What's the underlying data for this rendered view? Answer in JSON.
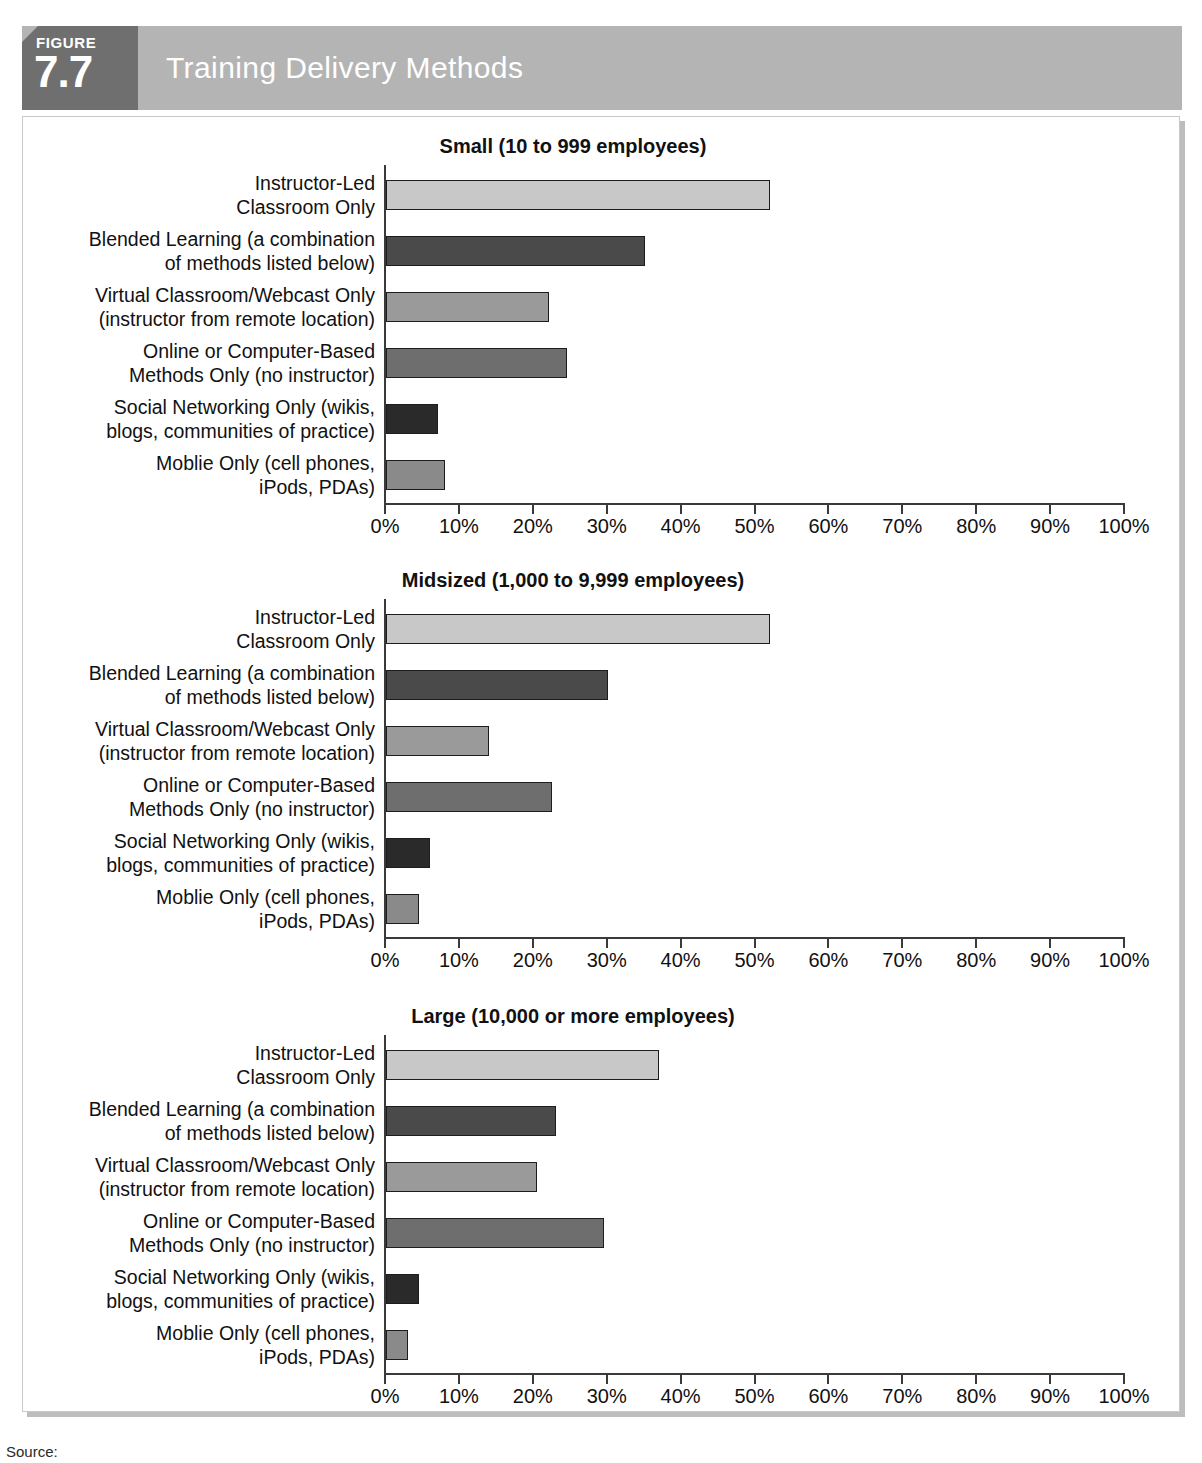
{
  "figure": {
    "tab_word": "FIGURE",
    "tab_number": "7.7",
    "title": "Training Delivery Methods"
  },
  "footer": {
    "source": "Source:"
  },
  "palette": {
    "banner_bg": "#b4b4b4",
    "tab_bg": "#6f6f6f",
    "frame_border": "#c9c9c9",
    "axis": "#3a3a3a",
    "bar_colors": [
      "#c8c8c8",
      "#4a4a4a",
      "#9a9a9a",
      "#6e6e6e",
      "#2a2a2a",
      "#8a8a8a"
    ]
  },
  "chart_data": {
    "type": "bar",
    "orientation": "horizontal",
    "title": "Training Delivery Methods",
    "xlabel": "",
    "ylabel": "",
    "xlim": [
      0,
      100
    ],
    "grid": false,
    "legend": "none",
    "tick_labels": [
      "0%",
      "10%",
      "20%",
      "30%",
      "40%",
      "50%",
      "60%",
      "70%",
      "80%",
      "90%",
      "100%"
    ],
    "tick_values": [
      0,
      10,
      20,
      30,
      40,
      50,
      60,
      70,
      80,
      90,
      100
    ],
    "categories": [
      "Instructor-Led Classroom Only",
      "Blended Learning (a combination of methods listed below)",
      "Virtual Classroom/Webcast Only (instructor from remote location)",
      "Online or Computer-Based Methods Only (no instructor)",
      "Social Networking Only (wikis, blogs, communities of practice)",
      "Moblie Only (cell phones, iPods, PDAs)"
    ],
    "category_lines": [
      [
        "Instructor-Led",
        "Classroom Only"
      ],
      [
        "Blended Learning (a combination",
        "of methods listed below)"
      ],
      [
        "Virtual Classroom/Webcast Only",
        "(instructor from remote location)"
      ],
      [
        "Online or Computer-Based",
        "Methods Only (no instructor)"
      ],
      [
        "Social Networking Only (wikis,",
        "blogs, communities of practice)"
      ],
      [
        "Moblie Only (cell phones,",
        "iPods, PDAs)"
      ]
    ],
    "panels": [
      {
        "title": "Small (10 to 999 employees)",
        "values": [
          52,
          35,
          22,
          24.5,
          7,
          8
        ]
      },
      {
        "title": "Midsized (1,000 to 9,999 employees)",
        "values": [
          52,
          30,
          14,
          22.5,
          6,
          4.5
        ]
      },
      {
        "title": "Large (10,000 or more employees)",
        "values": [
          37,
          23,
          20.5,
          29.5,
          4.5,
          3
        ]
      }
    ]
  }
}
